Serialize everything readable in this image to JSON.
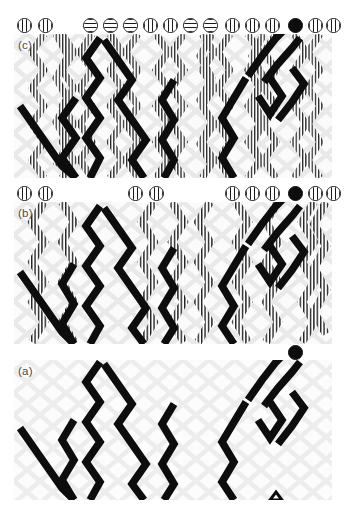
{
  "figure": {
    "width": 349,
    "height": 513,
    "background": "#ffffff",
    "colors": {
      "page_background": "#ffffff",
      "panel_background": "#fbfbfb",
      "lattice_grey": "#e7e7e7",
      "worldline_black": "#0d0d0d",
      "hatch_stroke": "#1a1a1a",
      "label_grey": "#4a4a4a",
      "marker_outline": "#141414"
    },
    "marker_legend": {
      "solid": "filled black circle particle",
      "vbar": "circle with vertical stripes particle",
      "hbar": "circle with horizontal stripes particle"
    }
  },
  "panels": [
    {
      "id": "c",
      "label": "(c)",
      "label_x": 18,
      "label_y": 40,
      "marker_row_y": 18,
      "panel_x": 14,
      "panel_y": 34,
      "panel_w": 318,
      "panel_h": 144,
      "markers": [
        {
          "x": 24,
          "type": "vbar"
        },
        {
          "x": 45,
          "type": "vbar"
        },
        {
          "x": 90,
          "type": "hbar"
        },
        {
          "x": 110,
          "type": "hbar"
        },
        {
          "x": 130,
          "type": "hbar"
        },
        {
          "x": 150,
          "type": "vbar"
        },
        {
          "x": 170,
          "type": "vbar"
        },
        {
          "x": 190,
          "type": "hbar"
        },
        {
          "x": 210,
          "type": "hbar"
        },
        {
          "x": 232,
          "type": "vbar"
        },
        {
          "x": 252,
          "type": "vbar"
        },
        {
          "x": 272,
          "type": "vbar"
        },
        {
          "x": 295,
          "type": "solid"
        },
        {
          "x": 315,
          "type": "vbar"
        },
        {
          "x": 333,
          "type": "vbar"
        }
      ],
      "black_path_count": 5,
      "hatched_path_count": 16,
      "notes": "Densest panel: the five heavy black worldlines of panel (a) plus many finely hatched worldlines filling the lattice."
    },
    {
      "id": "b",
      "label": "(b)",
      "label_x": 18,
      "label_y": 208,
      "marker_row_y": 186,
      "panel_x": 14,
      "panel_y": 202,
      "panel_w": 318,
      "panel_h": 142,
      "markers": [
        {
          "x": 24,
          "type": "vbar"
        },
        {
          "x": 45,
          "type": "vbar"
        },
        {
          "x": 135,
          "type": "vbar"
        },
        {
          "x": 156,
          "type": "vbar"
        },
        {
          "x": 232,
          "type": "vbar"
        },
        {
          "x": 252,
          "type": "vbar"
        },
        {
          "x": 272,
          "type": "vbar"
        },
        {
          "x": 295,
          "type": "solid"
        },
        {
          "x": 315,
          "type": "vbar"
        },
        {
          "x": 333,
          "type": "vbar"
        }
      ],
      "black_path_count": 5,
      "hatched_path_count": 9,
      "notes": "Intermediate panel: the heavy black worldlines of panel (a) together with a moderate number of hatched worldlines."
    },
    {
      "id": "a",
      "label": "(a)",
      "label_x": 18,
      "label_y": 363,
      "marker_row_y": 345,
      "panel_x": 14,
      "panel_y": 360,
      "panel_w": 318,
      "panel_h": 140,
      "markers": [
        {
          "x": 295,
          "type": "solid"
        }
      ],
      "black_path_count": 5,
      "hatched_path_count": 0,
      "notes": "Sparsest panel: only the heavy black worldlines on the faint grey lattice, with a single solid black particle marker."
    }
  ],
  "lattice": {
    "cell_width": 26,
    "cell_height": 22,
    "stroke": "#e7e7e7",
    "stroke_width": 4.5,
    "shape": "diamond"
  },
  "worldlines_black": [
    {
      "name": "wl-1",
      "points": "16,78 30,96 44,118 44,134 32,134 20,120 10,110"
    },
    {
      "name": "wl-2",
      "points": "44,118 58,132 44,140 30,140"
    },
    {
      "name": "wl-3",
      "points": "92,20 78,40 66,58 80,76 66,94 52,112 62,130 48,140"
    },
    {
      "name": "wl-4",
      "points": "96,22 110,40 124,58 112,74 126,92 140,110 128,128 140,140"
    },
    {
      "name": "wl-5",
      "points": "152,22 140,38 154,56 142,74 156,92"
    },
    {
      "name": "wl-6",
      "points": "172,62 160,80 172,98 160,116 172,134 162,140"
    },
    {
      "name": "wl-7",
      "points": "244,60 232,78 220,96 232,114 220,132 232,140"
    },
    {
      "name": "wl-8",
      "points": "246,58 260,42 274,26 288,12 296,4"
    },
    {
      "name": "wl-9",
      "points": "262,64 276,48 290,34 300,22"
    },
    {
      "name": "wl-10",
      "points": "256,78 268,94 280,78 268,62"
    },
    {
      "name": "wl-11",
      "points": "276,100 290,84 302,68 290,52"
    }
  ]
}
